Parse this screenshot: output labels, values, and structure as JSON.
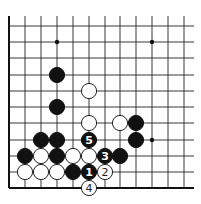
{
  "board": {
    "columns_x": [
      9,
      25,
      41,
      57,
      73,
      89,
      105,
      120,
      136,
      152,
      168,
      184
    ],
    "rows_y": [
      26,
      42,
      58,
      75,
      91,
      107,
      123,
      140,
      156,
      172,
      188
    ],
    "grid_top": 16,
    "grid_right": 194,
    "left_edge": true,
    "bottom_edge": true,
    "stone_radius": 7.6,
    "colors": {
      "black": "#111111",
      "white": "#ffffff",
      "line": "#222222"
    }
  },
  "star_points": [
    {
      "col": 3,
      "row": 1
    },
    {
      "col": 9,
      "row": 1
    },
    {
      "col": 9,
      "row": 7
    }
  ],
  "stones": [
    {
      "color": "black",
      "col": 3,
      "row": 3,
      "label": ""
    },
    {
      "color": "black",
      "col": 3,
      "row": 5,
      "label": ""
    },
    {
      "color": "white",
      "col": 5,
      "row": 4,
      "label": ""
    },
    {
      "color": "white",
      "col": 5,
      "row": 6,
      "label": ""
    },
    {
      "color": "white",
      "col": 7,
      "row": 6,
      "label": ""
    },
    {
      "color": "black",
      "col": 8,
      "row": 6,
      "label": ""
    },
    {
      "color": "black",
      "col": 2,
      "row": 7,
      "label": ""
    },
    {
      "color": "black",
      "col": 3,
      "row": 7,
      "label": ""
    },
    {
      "color": "black",
      "col": 5,
      "row": 7,
      "label": "5"
    },
    {
      "color": "black",
      "col": 8,
      "row": 7,
      "label": ""
    },
    {
      "color": "black",
      "col": 1,
      "row": 8,
      "label": ""
    },
    {
      "color": "white",
      "col": 2,
      "row": 8,
      "label": ""
    },
    {
      "color": "black",
      "col": 3,
      "row": 8,
      "label": ""
    },
    {
      "color": "white",
      "col": 4,
      "row": 8,
      "label": ""
    },
    {
      "color": "white",
      "col": 5,
      "row": 8,
      "label": ""
    },
    {
      "color": "black",
      "col": 6,
      "row": 8,
      "label": "3"
    },
    {
      "color": "black",
      "col": 7,
      "row": 8,
      "label": ""
    },
    {
      "color": "white",
      "col": 1,
      "row": 9,
      "label": ""
    },
    {
      "color": "white",
      "col": 2,
      "row": 9,
      "label": ""
    },
    {
      "color": "white",
      "col": 3,
      "row": 9,
      "label": ""
    },
    {
      "color": "black",
      "col": 4,
      "row": 9,
      "label": ""
    },
    {
      "color": "black",
      "col": 5,
      "row": 9,
      "label": "1"
    },
    {
      "color": "white",
      "col": 6,
      "row": 9,
      "label": "2"
    },
    {
      "color": "white",
      "col": 5,
      "row": 10,
      "label": "4"
    }
  ]
}
